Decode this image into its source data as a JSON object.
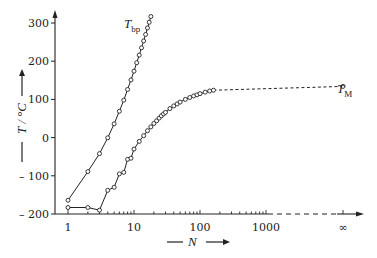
{
  "chart_data": {
    "type": "line",
    "title": "",
    "xlabel": "N",
    "ylabel": "T / °C",
    "xscale": "log",
    "x_tick_labels": [
      "1",
      "10",
      "100",
      "1000",
      "∞"
    ],
    "y_tick_labels": [
      "300",
      "200",
      "100",
      "0",
      "-100",
      "-200"
    ],
    "y_ticks": [
      300,
      200,
      100,
      0,
      -100,
      -200
    ],
    "ylim": [
      -200,
      320
    ],
    "xlim": [
      1,
      "∞"
    ],
    "grid": false,
    "legend": "inline labels at curve ends",
    "series": [
      {
        "name": "T_bp",
        "label_main": "T",
        "label_sub": "bp",
        "marker": "open-circle",
        "line": "solid",
        "x": [
          1,
          2,
          3,
          4,
          5,
          6,
          7,
          8,
          9,
          10,
          11,
          12,
          13,
          14,
          15,
          16,
          17,
          18
        ],
        "y": [
          -164,
          -89,
          -42,
          -0.5,
          36,
          69,
          98,
          126,
          151,
          174,
          196,
          216,
          235,
          253,
          270,
          287,
          302,
          317
        ]
      },
      {
        "name": "T_M",
        "label_main": "T",
        "label_sub": "M",
        "marker": "open-circle",
        "line": "solid to N≈160, dashed extrapolation to N=∞",
        "x": [
          1,
          2,
          3,
          4,
          5,
          6,
          7,
          8,
          9,
          10,
          12,
          14,
          16,
          18,
          20,
          22,
          24,
          26,
          28,
          30,
          35,
          40,
          45,
          50,
          60,
          70,
          80,
          90,
          100,
          120,
          140,
          160,
          "∞"
        ],
        "y": [
          -183,
          -183,
          -190,
          -138,
          -130,
          -95,
          -91,
          -57,
          -54,
          -30,
          -10,
          5,
          18,
          28,
          37,
          44,
          51,
          57,
          62,
          66,
          76,
          83,
          88,
          93,
          100,
          105,
          109,
          112,
          115,
          119,
          122,
          124,
          134
        ]
      }
    ]
  },
  "labels": {
    "y_axis_title": "T / °C",
    "x_axis_title": "N",
    "series_bp_main": "T",
    "series_bp_sub": "bp",
    "series_m_main": "T",
    "series_m_sub": "M",
    "x_ticks": [
      "1",
      "10",
      "100",
      "1000",
      "∞"
    ],
    "y_ticks": [
      "300",
      "200",
      "100",
      "0",
      "– 100",
      "– 200"
    ]
  },
  "colors": {
    "line": "#222222",
    "marker_fill": "#ffffff",
    "background": "#ffffff"
  }
}
